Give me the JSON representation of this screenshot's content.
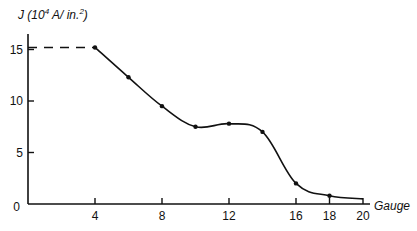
{
  "chart_data": {
    "type": "line",
    "title": "",
    "xlabel": "Gauge",
    "ylabel": "J (10^4 A/in.^2)",
    "ylabel_parts": {
      "prefix": "J (10",
      "exp1": "4",
      "mid": " A/ in.",
      "exp2": "2",
      "suffix": ")"
    },
    "xlim": [
      0,
      20
    ],
    "ylim": [
      0,
      16.5
    ],
    "grid": false,
    "legend": null,
    "x_ticks": [
      4,
      8,
      12,
      16,
      18,
      20
    ],
    "y_ticks": [
      0,
      5,
      10,
      15
    ],
    "x_tick_labels": [
      "4",
      "8",
      "12",
      "16",
      "18",
      "20"
    ],
    "y_tick_labels": [
      "0",
      "5",
      "10",
      "15"
    ],
    "series": [
      {
        "name": "Current density",
        "style": "solid smooth with point markers",
        "x": [
          4,
          6,
          8,
          10,
          12,
          14,
          16,
          18,
          20
        ],
        "y": [
          15.2,
          12.3,
          9.5,
          7.5,
          7.8,
          7.0,
          2.0,
          0.8,
          0.5
        ],
        "markers_at": [
          4,
          6,
          8,
          10,
          12,
          14,
          16,
          18
        ]
      },
      {
        "name": "Extrapolated limit",
        "style": "dashed",
        "x": [
          0,
          4
        ],
        "y": [
          15.2,
          15.2
        ]
      }
    ],
    "colors": {
      "line": "#111111",
      "axis": "#111111",
      "background": "#ffffff"
    }
  }
}
